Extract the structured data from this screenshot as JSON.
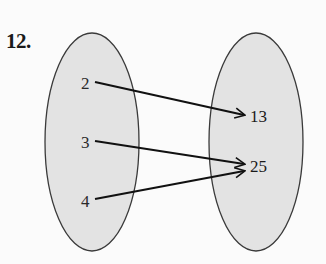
{
  "problem": {
    "number": "12."
  },
  "mapping": {
    "domain": {
      "elements": [
        "2",
        "3",
        "4"
      ],
      "fill": "#e3e3e3",
      "stroke": "#3a3a3a"
    },
    "range": {
      "elements": [
        "13",
        "25"
      ],
      "fill": "#e3e3e3",
      "stroke": "#3a3a3a"
    },
    "arrows": [
      {
        "from": "2",
        "to": "13"
      },
      {
        "from": "3",
        "to": "25"
      },
      {
        "from": "4",
        "to": "25"
      }
    ],
    "arrow_color": "#111111"
  }
}
